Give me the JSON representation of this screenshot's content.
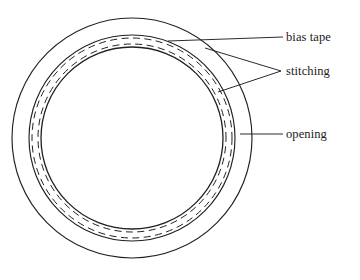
{
  "figure": {
    "name": "sewing-pattern-circular-cushion-diagram",
    "background_color": "#ffffff",
    "line_color": "#231f20",
    "text_color": "#1a1a1a"
  },
  "labels": {
    "bias_tape": "bias tape",
    "stitching": "stitching",
    "opening": "opening"
  },
  "geometry": {
    "center": {
      "x": 132,
      "y": 138
    },
    "circles": [
      {
        "name": "outer-fabric-edge",
        "radius": 120,
        "style": "solid"
      },
      {
        "name": "bias-tape-outer-edge",
        "radius": 103,
        "style": "solid"
      },
      {
        "name": "stitching-outer",
        "radius": 100,
        "style": "dashed"
      },
      {
        "name": "stitching-inner",
        "radius": 94,
        "style": "dashed"
      },
      {
        "name": "bias-tape-inner-edge",
        "radius": 91,
        "style": "solid"
      }
    ],
    "leaders": [
      {
        "name": "leader-bias-tape",
        "from": {
          "x": 283,
          "y": 37
        },
        "to": {
          "x": 168,
          "y": 41
        }
      },
      {
        "name": "leader-stitching-outer",
        "from": {
          "x": 281,
          "y": 71
        },
        "to": {
          "x": 205,
          "y": 48
        }
      },
      {
        "name": "leader-stitching-inner",
        "from": {
          "x": 281,
          "y": 71
        },
        "to": {
          "x": 218,
          "y": 92
        }
      },
      {
        "name": "leader-opening",
        "from": {
          "x": 283,
          "y": 134
        },
        "to": {
          "x": 240,
          "y": 134
        }
      }
    ]
  }
}
